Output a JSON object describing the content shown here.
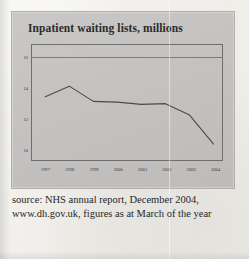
{
  "figure": {
    "title": "Inpatient waiting lists, millions",
    "caption": "source: NHS annual report, December 2004, www.dh.gov.uk, figures as at March of the year"
  },
  "chart_data": {
    "type": "line",
    "title": "Inpatient waiting lists, millions",
    "xlabel": "",
    "ylabel": "millions",
    "categories": [
      "1997",
      "1998",
      "1999",
      "2000",
      "2001",
      "2002",
      "2003",
      "2004"
    ],
    "x": [
      1997,
      1998,
      1999,
      2000,
      2001,
      2002,
      2003,
      2004
    ],
    "values": [
      13.4,
      14.1,
      13.1,
      13.05,
      12.9,
      12.95,
      12.2,
      10.3
    ],
    "series": [
      {
        "name": "Inpatient waiting lists",
        "values": [
          13.4,
          14.1,
          13.1,
          13.05,
          12.9,
          12.95,
          12.2,
          10.3
        ]
      }
    ],
    "ylim": [
      9.2,
      16.8
    ],
    "yticks": [
      16,
      14,
      12,
      10
    ],
    "ytick_labels": [
      "16",
      "14",
      "12",
      "10"
    ],
    "xtick_labels": [
      "1997",
      "1998",
      "1999",
      "2000",
      "2001",
      "2002",
      "2003",
      "2004"
    ],
    "grid": true,
    "gridlines": [
      16
    ],
    "legend": false,
    "line_color": "#4a4a48",
    "panel_color": "#c4c3c1"
  }
}
